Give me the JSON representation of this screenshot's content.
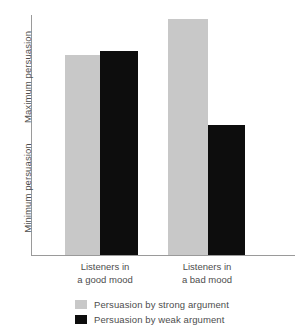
{
  "chart_data": {
    "type": "bar",
    "title": "",
    "subtitle": "",
    "xlabel": "",
    "ylabel": "",
    "grid": false,
    "legend_position": "bottom",
    "categories": [
      "Listeners in a good mood",
      "Listeners in a bad mood"
    ],
    "category_lines": [
      [
        "Listeners in",
        "a good mood"
      ],
      [
        "Listeners in",
        "a bad mood"
      ]
    ],
    "y_axis": {
      "min_label": "Minimum persuasion",
      "max_label": "Maximum persuasion",
      "ticks": [],
      "ylim": [
        0,
        100
      ]
    },
    "series": [
      {
        "name": "Persuasion by strong argument",
        "color": "#c8c8c8",
        "values": [
          83,
          98
        ]
      },
      {
        "name": "Persuasion by weak argument",
        "color": "#0d0d0d",
        "values": [
          85,
          54
        ]
      }
    ]
  },
  "axis": {
    "y_max_label": "Maximum persuasion",
    "y_min_label": "Minimum persuasion"
  },
  "categories": [
    {
      "line1": "Listeners in",
      "line2": "a good mood"
    },
    {
      "line1": "Listeners in",
      "line2": "a bad mood"
    }
  ],
  "legend": {
    "items": [
      {
        "label": "Persuasion by strong argument",
        "color": "#c8c8c8"
      },
      {
        "label": "Persuasion by weak argument",
        "color": "#0d0d0d"
      }
    ]
  },
  "colors": {
    "strong": "#c8c8c8",
    "weak": "#0d0d0d",
    "axis": "#9a9a9a",
    "text": "#4d4d4d",
    "background": "#ffffff"
  },
  "geometry": {
    "baseline_y": 255,
    "axis_top_y": 15,
    "axis_x": 31,
    "axis_right_x": 295,
    "bars": [
      {
        "name": "good-strong",
        "x": 65,
        "width": 35,
        "top": 55
      },
      {
        "name": "good-weak",
        "x": 100,
        "width": 38,
        "top": 51
      },
      {
        "name": "bad-strong",
        "x": 168,
        "width": 40,
        "top": 19
      },
      {
        "name": "bad-weak",
        "x": 208,
        "width": 37,
        "top": 125
      }
    ],
    "category_label_x": [
      105,
      207
    ],
    "category_label_y": 261
  }
}
